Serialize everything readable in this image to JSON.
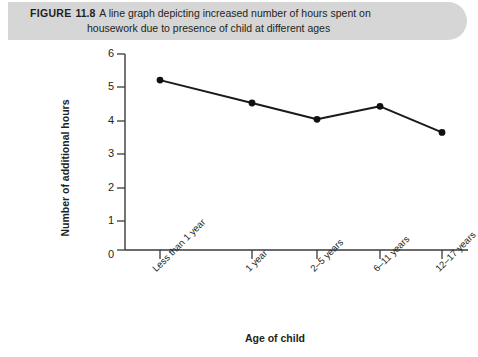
{
  "caption": {
    "figure_word": "FIGURE",
    "figure_number": "11.8",
    "line1": "A line graph depicting increased number of hours spent on",
    "line2": "housework due to presence of child at different ages"
  },
  "colors": {
    "banner_background": "#d6d6d6",
    "text": "#231f20",
    "axis": "#3a3a3a",
    "line": "#1a1a1a",
    "marker": "#111111",
    "page_background": "#ffffff"
  },
  "chart_data": {
    "type": "line",
    "title": "",
    "xlabel": "Age of child",
    "ylabel": "Number of additional hours",
    "categories": [
      "Less than 1 year",
      "1 year",
      "2–5 years",
      "6–11 years",
      "12–17 years"
    ],
    "values": [
      5.2,
      4.5,
      4.0,
      4.4,
      3.6
    ],
    "series": [
      {
        "name": "Additional hours of housework",
        "values": [
          5.2,
          4.5,
          4.0,
          4.4,
          3.6
        ]
      }
    ],
    "ylim": [
      0,
      6
    ],
    "yticks": [
      0,
      1,
      2,
      3,
      4,
      5,
      6
    ],
    "ytick_labels": [
      "0",
      "1",
      "2",
      "3",
      "4",
      "5",
      "6"
    ],
    "grid": false,
    "legend": false,
    "legend_position": "none",
    "marker": "filled-circle",
    "xtick_label_rotation": -45
  }
}
